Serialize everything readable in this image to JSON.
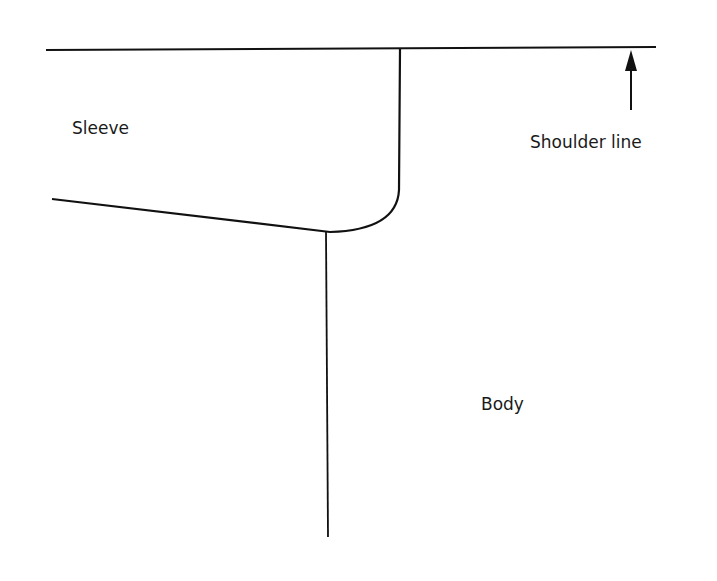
{
  "diagram": {
    "type": "garment pattern detail - sleeve/body junction",
    "labels": {
      "sleeve": "Sleeve",
      "shoulder_line": "Shoulder line",
      "body": "Body"
    },
    "colors": {
      "line": "#111111",
      "background": "#ffffff"
    }
  }
}
